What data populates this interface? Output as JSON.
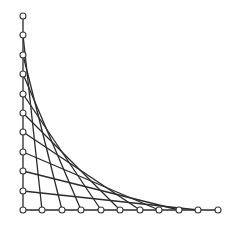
{
  "diagram": {
    "type": "string-art-envelope",
    "colors": {
      "line": "#2b2b2b",
      "peg_stroke": "#3a3a3a",
      "peg_fill": "#ffffff",
      "background": "#ffffff"
    },
    "origin": {
      "x": 23,
      "y": 210
    },
    "vertical_axis": {
      "top": {
        "x": 23,
        "y": 16
      },
      "peg_count": 11
    },
    "horizontal_axis": {
      "right": {
        "x": 218,
        "y": 210
      },
      "peg_count": 11
    },
    "vertical_pegs": [
      {
        "x": 23,
        "y": 16
      },
      {
        "x": 23,
        "y": 35
      },
      {
        "x": 23,
        "y": 55
      },
      {
        "x": 23,
        "y": 74
      },
      {
        "x": 23,
        "y": 94
      },
      {
        "x": 23,
        "y": 113
      },
      {
        "x": 23,
        "y": 132
      },
      {
        "x": 23,
        "y": 152
      },
      {
        "x": 23,
        "y": 171
      },
      {
        "x": 23,
        "y": 191
      },
      {
        "x": 23,
        "y": 210
      }
    ],
    "horizontal_pegs": [
      {
        "x": 23,
        "y": 210
      },
      {
        "x": 42,
        "y": 210
      },
      {
        "x": 62,
        "y": 210
      },
      {
        "x": 81,
        "y": 210
      },
      {
        "x": 101,
        "y": 210
      },
      {
        "x": 120,
        "y": 210
      },
      {
        "x": 140,
        "y": 210
      },
      {
        "x": 159,
        "y": 210
      },
      {
        "x": 179,
        "y": 210
      },
      {
        "x": 198,
        "y": 210
      },
      {
        "x": 218,
        "y": 210
      }
    ],
    "connection_rule": "vertical peg i (from top) joins horizontal peg i (from left)",
    "peg_radius": 3
  }
}
